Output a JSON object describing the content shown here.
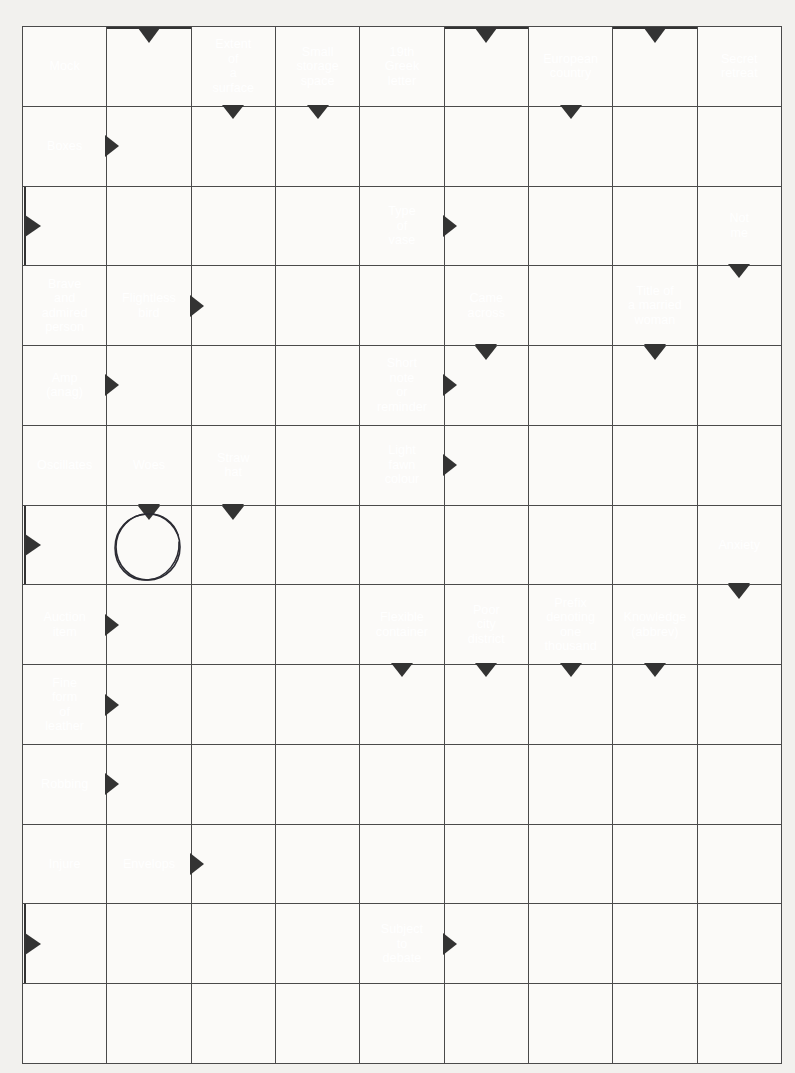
{
  "puzzle": {
    "type": "arrowword-crossword",
    "columns": 9,
    "rows": 13,
    "colors": {
      "clue_background": "#333333",
      "clue_text": "#ffffff",
      "cell_background": "#fbfaf8",
      "grid_line": "#4a4a4a",
      "page_background": "#f2f1ee",
      "annotation_ink": "#2b2b33"
    },
    "annotation": {
      "name": "hand-drawn-circle",
      "row": 7,
      "col": 2
    },
    "clues": {
      "mock": "Mock",
      "extent_of_a_surface": "Extent\nof\na\nsurface",
      "small_storage_space": "Small\nstorage\nspace",
      "greek_letter": "19th\nGreek\nletter",
      "european_country": "European\ncountry",
      "secret_retreat": "Secret\nretreat",
      "boxes": "Boxes",
      "type_of_vase": "Type\nof\nvase",
      "not_me": "Not\nme",
      "brave_person": "Brave\nand\nadmired\nperson",
      "flightless_bird": "Flightless\nbird",
      "came_across": "Came\nacross",
      "title_married_woman": "Title of\na married\nwoman",
      "amp_anag": "Amp\n(anag)",
      "short_note": "Short\nnote\nor\nreminder",
      "oscillates": "Oscillates",
      "woes": "Woes",
      "straw_hat": "Straw\nhat",
      "light_fawn_colour": "Light\nfawn\ncolour",
      "anxiety": "Anxiety",
      "auction_item": "Auction\nitem",
      "flexible_container": "Flexible\ncontainer",
      "poor_city_district": "Poor\ncity\ndistrict",
      "prefix_one_thousand": "Prefix\ndenoting\none\nthousand",
      "knowledge_abbrev": "Knowledge\n(abbrev)",
      "fine_leather": "Fine\nform\nof\nleather",
      "robbing": "Robbing",
      "injure": "Injure",
      "envelops": "Envelops",
      "subject_to_debate": "Subject\nto\ndebate"
    }
  }
}
